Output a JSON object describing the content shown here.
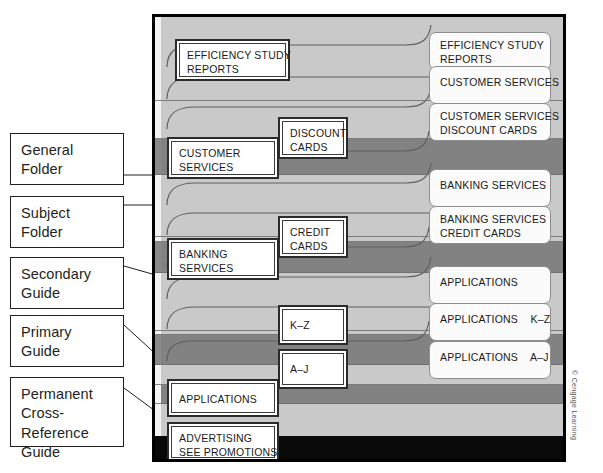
{
  "figure": {
    "credit": "© Cengage Learning"
  },
  "legend": {
    "items": [
      {
        "id": "general-folder",
        "lines": [
          "General",
          "Folder"
        ]
      },
      {
        "id": "subject-folder",
        "lines": [
          "Subject",
          "Folder"
        ]
      },
      {
        "id": "secondary-guide",
        "lines": [
          "Secondary",
          "Guide"
        ]
      },
      {
        "id": "primary-guide",
        "lines": [
          "Primary",
          "Guide"
        ]
      },
      {
        "id": "permanent-cross-reference-guide",
        "lines": [
          "Permanent",
          "Cross-Reference",
          "Guide"
        ]
      }
    ]
  },
  "drawer": {
    "left_tabs": [
      {
        "id": "efficiency-study-reports",
        "lines": [
          "EFFICIENCY STUDY",
          "REPORTS"
        ]
      },
      {
        "id": "customer-services",
        "lines": [
          "CUSTOMER",
          "SERVICES"
        ]
      },
      {
        "id": "banking-services",
        "lines": [
          "BANKING",
          "SERVICES"
        ]
      },
      {
        "id": "applications",
        "lines": [
          "APPLICATIONS"
        ]
      },
      {
        "id": "advertising-see-promotions",
        "lines": [
          "ADVERTISING",
          "SEE PROMOTIONS"
        ]
      }
    ],
    "center_tabs": [
      {
        "id": "discount-cards",
        "lines": [
          "DISCOUNT",
          "CARDS"
        ]
      },
      {
        "id": "credit-cards",
        "lines": [
          "CREDIT",
          "CARDS"
        ]
      },
      {
        "id": "k-z",
        "lines": [
          "K–Z"
        ]
      },
      {
        "id": "a-j",
        "lines": [
          "A–J"
        ]
      }
    ],
    "right_tabs": [
      {
        "id": "r-efficiency-study-reports",
        "lines": [
          "EFFICIENCY STUDY",
          "REPORTS"
        ]
      },
      {
        "id": "r-customer-services",
        "lines": [
          "CUSTOMER SERVICES"
        ]
      },
      {
        "id": "r-customer-services-discount",
        "lines": [
          "CUSTOMER SERVICES",
          "DISCOUNT CARDS"
        ]
      },
      {
        "id": "r-banking-services",
        "lines": [
          "BANKING SERVICES"
        ]
      },
      {
        "id": "r-banking-services-credit",
        "lines": [
          "BANKING SERVICES",
          "CREDIT CARDS"
        ]
      },
      {
        "id": "r-applications",
        "lines": [
          "APPLICATIONS"
        ]
      },
      {
        "id": "r-applications-k-z",
        "lines": [
          "APPLICATIONS    K–Z"
        ]
      },
      {
        "id": "r-applications-a-j",
        "lines": [
          "APPLICATIONS    A–J"
        ]
      }
    ]
  },
  "colors": {
    "band_light": "#c9c9c9",
    "band_mid": "#bdbdbd",
    "band_dark": "#828282",
    "band_black": "#090909",
    "frame": "#000000",
    "tab_fill": "#ffffff",
    "line": "#231f20"
  }
}
